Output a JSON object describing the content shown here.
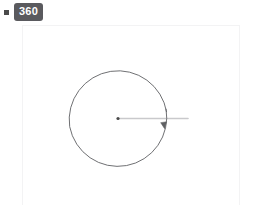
{
  "badge": {
    "bullet_icon": "square-bullet-icon",
    "label": "360",
    "background_color": "#5a5a5e",
    "text_color": "#ffffff"
  },
  "canvas": {
    "border_color": "#f3f3f4",
    "background_color": "#ffffff",
    "x": 22,
    "y": 25,
    "width": 218,
    "height": 195
  },
  "chart_data": {
    "type": "diagram",
    "title": "360",
    "annotations": [
      {
        "label": "360",
        "kind": "angle-measure",
        "unit": "degrees",
        "value": 360
      }
    ],
    "geometry": {
      "center": {
        "x": 118,
        "y": 118.5
      },
      "radius": 49,
      "arc": {
        "name": "rotation-arc",
        "start_angle_deg": -11,
        "end_angle_deg": 352,
        "sweep_deg": 363,
        "direction": "clockwise",
        "stroke_color": "#5f6063",
        "stroke_width": 0.9
      },
      "arrow_head": {
        "name": "arc-arrowhead",
        "x": 164,
        "y": 124.5,
        "size": 4.2,
        "fill_color": "#5f6063"
      },
      "center_dot": {
        "name": "center-vertex-dot",
        "x": 118,
        "y": 118.5,
        "radius": 1.6,
        "fill_color": "#4a4a4a"
      },
      "ray": {
        "name": "initial-side-ray",
        "x1": 118,
        "y1": 118.5,
        "x2": 188,
        "y2": 118.5,
        "stroke_color": "#c9c9cc",
        "stroke_width": 1.6
      }
    },
    "colors": {
      "arc": "#5f6063",
      "ray": "#c9c9cc",
      "vertex": "#4a4a4a",
      "badge": "#5a5a5e"
    }
  }
}
